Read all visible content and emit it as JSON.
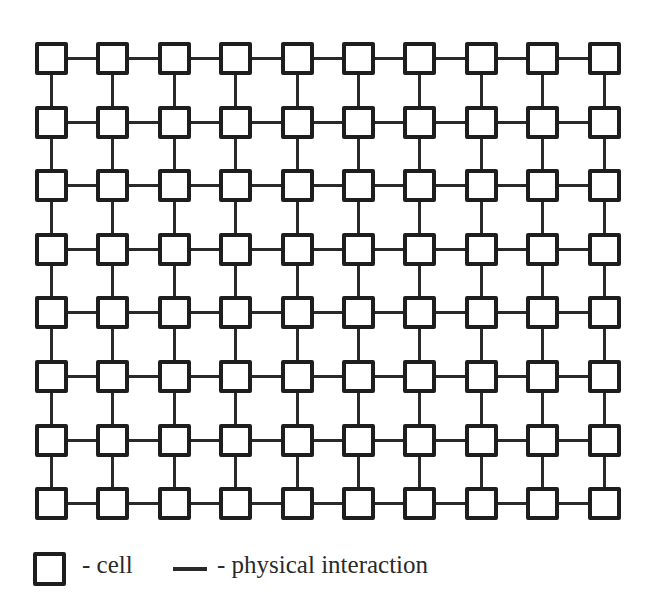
{
  "diagram": {
    "type": "lattice-grid",
    "rows": 8,
    "columns": 10,
    "node_label": "cell",
    "edge_label": "physical interaction",
    "colors": {
      "stroke": "#1e1e1e",
      "background": "#ffffff"
    }
  },
  "legend": {
    "cell_text": "- cell",
    "interaction_text": "- physical interaction"
  }
}
